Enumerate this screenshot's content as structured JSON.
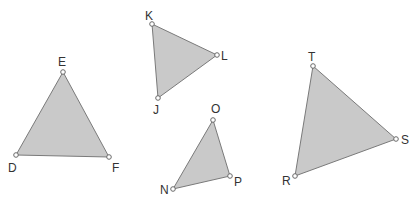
{
  "diagram": {
    "title": "",
    "style": {
      "fill": "#c9c9c9",
      "stroke": "#7a7a7a",
      "vertex_stroke": "#6a6a6a",
      "label_color": "#333333"
    },
    "triangles": [
      {
        "name": "DEF",
        "vertices": [
          {
            "label": "D",
            "x": 16,
            "y": 155,
            "lx": 8,
            "ly": 172
          },
          {
            "label": "E",
            "x": 63,
            "y": 72,
            "lx": 58,
            "ly": 66
          },
          {
            "label": "F",
            "x": 109,
            "y": 157,
            "lx": 112,
            "ly": 172
          }
        ]
      },
      {
        "name": "JKL",
        "vertices": [
          {
            "label": "J",
            "x": 158,
            "y": 98,
            "lx": 153,
            "ly": 114
          },
          {
            "label": "K",
            "x": 152,
            "y": 24,
            "lx": 145,
            "ly": 20
          },
          {
            "label": "L",
            "x": 217,
            "y": 55,
            "lx": 221,
            "ly": 60
          }
        ]
      },
      {
        "name": "NOP",
        "vertices": [
          {
            "label": "N",
            "x": 173,
            "y": 189,
            "lx": 160,
            "ly": 194
          },
          {
            "label": "O",
            "x": 213,
            "y": 120,
            "lx": 211,
            "ly": 113
          },
          {
            "label": "P",
            "x": 230,
            "y": 176,
            "lx": 234,
            "ly": 186
          }
        ]
      },
      {
        "name": "RST",
        "vertices": [
          {
            "label": "R",
            "x": 295,
            "y": 176,
            "lx": 282,
            "ly": 185
          },
          {
            "label": "S",
            "x": 396,
            "y": 139,
            "lx": 401,
            "ly": 144
          },
          {
            "label": "T",
            "x": 313,
            "y": 66,
            "lx": 308,
            "ly": 61
          }
        ]
      }
    ]
  }
}
